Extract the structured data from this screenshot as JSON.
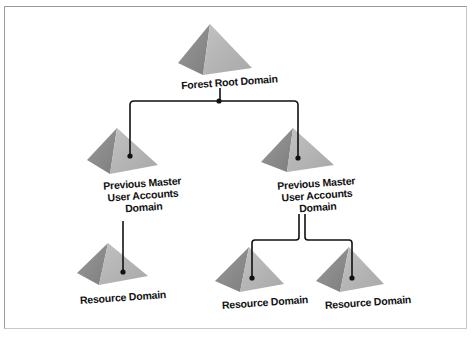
{
  "diagram": {
    "type": "tree",
    "nodes": [
      {
        "id": "root",
        "label": "Forest Root Domain"
      },
      {
        "id": "pm1",
        "label_lines": [
          "Previous Master",
          "User Accounts",
          "Domain"
        ]
      },
      {
        "id": "pm2",
        "label_lines": [
          "Previous Master",
          "User Accounts",
          "Domain"
        ]
      },
      {
        "id": "rd1",
        "label": "Resource Domain"
      },
      {
        "id": "rd2",
        "label": "Resource Domain"
      },
      {
        "id": "rd3",
        "label": "Resource Domain"
      }
    ],
    "edges": [
      {
        "from": "root",
        "to": "pm1"
      },
      {
        "from": "root",
        "to": "pm2"
      },
      {
        "from": "pm1",
        "to": "rd1"
      },
      {
        "from": "pm2",
        "to": "rd2"
      },
      {
        "from": "pm2",
        "to": "rd3"
      }
    ],
    "colors": {
      "pyramid_light": "#b5b5b5",
      "pyramid_dark": "#8a8a8a",
      "line": "#111111"
    }
  }
}
